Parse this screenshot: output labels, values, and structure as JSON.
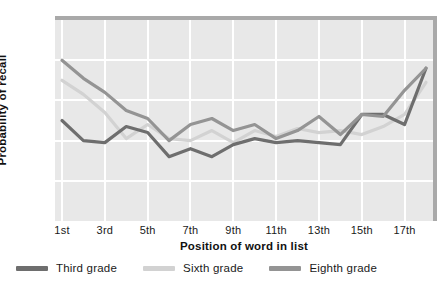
{
  "chart_data": {
    "type": "line",
    "title": "",
    "xlabel": "Position of word in list",
    "ylabel": "Probability of recall",
    "xtick_labels": [
      "1st",
      "3rd",
      "5th",
      "7th",
      "9th",
      "11th",
      "13th",
      "15th",
      "17th"
    ],
    "ytick_labels": [
      "20",
      "40",
      "60",
      "80"
    ],
    "ylim": [
      0,
      100
    ],
    "xlim": [
      1,
      18
    ],
    "yticks": [
      20,
      40,
      60,
      80
    ],
    "grid": true,
    "legend_position": "below-plot",
    "x": [
      1,
      2,
      3,
      4,
      5,
      6,
      7,
      8,
      9,
      10,
      11,
      12,
      13,
      14,
      15,
      16,
      17,
      18
    ],
    "series": [
      {
        "name": "Third grade",
        "color": "#6e6e6e",
        "values": [
          50,
          40,
          39,
          47,
          44,
          32,
          36,
          32,
          38,
          41,
          39,
          40,
          39,
          38,
          53,
          53,
          48,
          76
        ]
      },
      {
        "name": "Sixth grade",
        "color": "#d2d2d2",
        "values": [
          70,
          63,
          54,
          41,
          48,
          41,
          40,
          45,
          39,
          45,
          42,
          46,
          44,
          45,
          43,
          47,
          53,
          69
        ]
      },
      {
        "name": "Eighth grade",
        "color": "#949494",
        "values": [
          80,
          71,
          64,
          55,
          51,
          40,
          48,
          51,
          45,
          48,
          41,
          45,
          52,
          43,
          53,
          52,
          65,
          76
        ]
      }
    ]
  },
  "legend": {
    "items": [
      {
        "label": "Third grade",
        "color": "#6e6e6e"
      },
      {
        "label": "Sixth grade",
        "color": "#d2d2d2"
      },
      {
        "label": "Eighth grade",
        "color": "#949494"
      }
    ]
  },
  "colors": {
    "plot_background": "#e8e8e8",
    "grid": "#ffffff",
    "frame_shadow": "#a9a9a9",
    "page_background": "#ffffff",
    "text": "#1a1a1a"
  }
}
